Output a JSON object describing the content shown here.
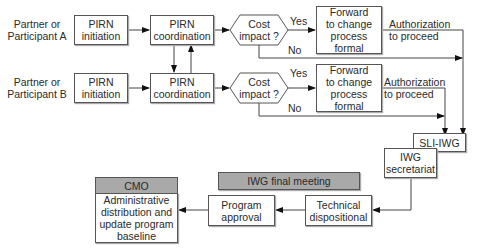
{
  "rows": [
    {
      "participant": "Partner or\nParticipant A",
      "initiation": "PIRN\ninitiation",
      "coordination": "PIRN\ncoordination",
      "decision": "Cost\nimpact ?",
      "yes_label": "Yes",
      "no_label": "No",
      "forward": "Forward\nto change\nprocess\nformal",
      "authorization": "Authorization\nto proceed"
    },
    {
      "participant": "Partner or\nParticipant B",
      "initiation": "PIRN\ninitiation",
      "coordination": "PIRN\ncoordination",
      "decision": "Cost\nimpact ?",
      "yes_label": "Yes",
      "no_label": "No",
      "forward": "Forward\nto change\nprocess\nformal",
      "authorization": "Authorization\nto proceed"
    }
  ],
  "sli_iwg": "SLI-IWG",
  "iwg_secretariat": "IWG\nsecretariat",
  "iwg_final_meeting": "IWG final meeting",
  "technical_dispositional": "Technical\ndispositional",
  "program_approval": "Program\napproval",
  "cmo": {
    "header": "CMO",
    "body": "Administrative\ndistribution and\nupdate program\nbaseline"
  },
  "colors": {
    "line": "#444444",
    "box_border": "#555555",
    "header_fill": "#a9a9a9"
  }
}
